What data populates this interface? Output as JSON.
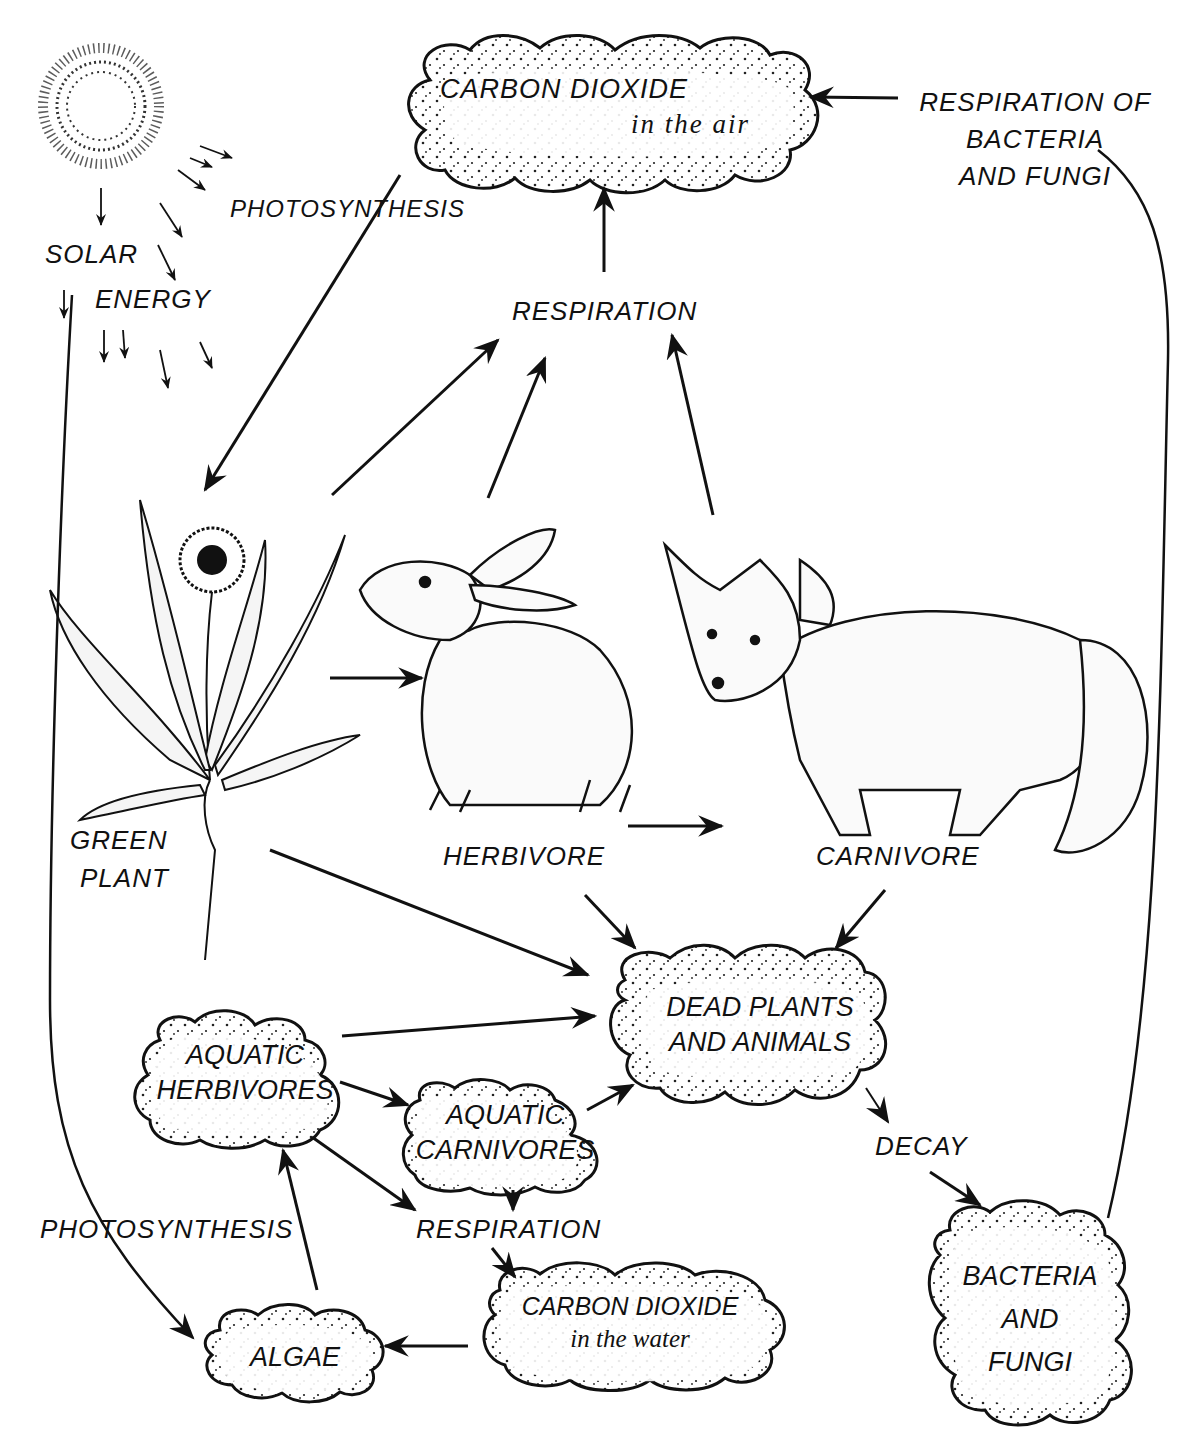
{
  "diagram": {
    "type": "carbon-cycle",
    "sun": {
      "label_line1": "SOLAR",
      "label_line2": "ENERGY"
    },
    "process_labels": {
      "photosynthesis_land": "PHOTOSYNTHESIS",
      "photosynthesis_water": "PHOTOSYNTHESIS",
      "respiration_land": "RESPIRATION",
      "respiration_water": "RESPIRATION",
      "respiration_decomposers_line1": "RESPIRATION OF",
      "respiration_decomposers_line2": "BACTERIA",
      "respiration_decomposers_line3": "AND FUNGI",
      "decay": "DECAY"
    },
    "organisms": {
      "green_plant_line1": "GREEN",
      "green_plant_line2": "PLANT",
      "herbivore": "HERBIVORE",
      "carnivore": "CARNIVORE"
    },
    "clouds": {
      "co2_air": {
        "line1": "CARBON DIOXIDE",
        "line2": "in the air"
      },
      "dead": {
        "line1": "DEAD PLANTS",
        "line2": "AND ANIMALS"
      },
      "aquatic_herbivores": {
        "line1": "AQUATIC",
        "line2": "HERBIVORES"
      },
      "aquatic_carnivores": {
        "line1": "AQUATIC",
        "line2": "CARNIVORES"
      },
      "co2_water": {
        "line1": "CARBON DIOXIDE",
        "line2": "in the water"
      },
      "algae": {
        "line1": "ALGAE"
      },
      "bacteria": {
        "line1": "BACTERIA",
        "line2": "AND",
        "line3": "FUNGI"
      }
    },
    "edges": [
      {
        "from": "sun",
        "to": "green plant",
        "label": "PHOTOSYNTHESIS"
      },
      {
        "from": "CO2 in the air",
        "to": "green plant"
      },
      {
        "from": "green plant",
        "to": "RESPIRATION"
      },
      {
        "from": "herbivore",
        "to": "RESPIRATION"
      },
      {
        "from": "carnivore",
        "to": "RESPIRATION"
      },
      {
        "from": "RESPIRATION",
        "to": "CO2 in the air"
      },
      {
        "from": "green plant",
        "to": "herbivore"
      },
      {
        "from": "herbivore",
        "to": "carnivore"
      },
      {
        "from": "green plant",
        "to": "dead plants and animals"
      },
      {
        "from": "herbivore",
        "to": "dead plants and animals"
      },
      {
        "from": "carnivore",
        "to": "dead plants and animals"
      },
      {
        "from": "aquatic herbivores",
        "to": "dead plants and animals"
      },
      {
        "from": "aquatic carnivores",
        "to": "dead plants and animals"
      },
      {
        "from": "aquatic herbivores",
        "to": "aquatic carnivores"
      },
      {
        "from": "aquatic herbivores",
        "to": "RESPIRATION (water)"
      },
      {
        "from": "aquatic carnivores",
        "to": "RESPIRATION (water)"
      },
      {
        "from": "RESPIRATION (water)",
        "to": "CO2 in the water"
      },
      {
        "from": "CO2 in the water",
        "to": "algae"
      },
      {
        "from": "algae",
        "to": "aquatic herbivores"
      },
      {
        "from": "sun",
        "to": "algae",
        "label": "PHOTOSYNTHESIS"
      },
      {
        "from": "dead plants and animals",
        "to": "bacteria and fungi",
        "label": "DECAY"
      },
      {
        "from": "bacteria and fungi",
        "to": "CO2 in the air",
        "label": "RESPIRATION OF BACTERIA AND FUNGI"
      }
    ]
  }
}
